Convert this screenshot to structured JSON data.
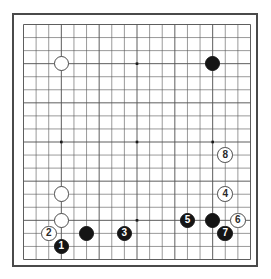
{
  "board": {
    "title": "Go board diagram",
    "size": 19,
    "line_color": "#555555",
    "border_color": "#4a4a4a",
    "background_color": "#ffffff",
    "black_color": "#151515",
    "white_color": "#ffffff",
    "star_points": [
      {
        "col": 3,
        "row": 3
      },
      {
        "col": 9,
        "row": 3
      },
      {
        "col": 15,
        "row": 3
      },
      {
        "col": 3,
        "row": 9
      },
      {
        "col": 9,
        "row": 9
      },
      {
        "col": 15,
        "row": 9
      },
      {
        "col": 3,
        "row": 15
      },
      {
        "col": 9,
        "row": 15
      },
      {
        "col": 15,
        "row": 15
      }
    ],
    "stones": [
      {
        "name": "white-stone-upper-left",
        "color": "white",
        "col": 3,
        "row": 3,
        "label": ""
      },
      {
        "name": "black-stone-upper-right",
        "color": "black",
        "col": 15,
        "row": 3,
        "label": ""
      },
      {
        "name": "white-stone-left-side",
        "color": "white",
        "col": 3,
        "row": 13,
        "label": ""
      },
      {
        "name": "white-stone-lower-left",
        "color": "white",
        "col": 3,
        "row": 15,
        "label": ""
      },
      {
        "name": "black-stone-lower-left",
        "color": "black",
        "col": 5,
        "row": 16,
        "label": ""
      },
      {
        "name": "black-stone-bottom-right",
        "color": "black",
        "col": 15,
        "row": 15,
        "label": ""
      },
      {
        "name": "move-stone-1",
        "color": "black",
        "col": 3,
        "row": 17,
        "label": "1"
      },
      {
        "name": "move-stone-2",
        "color": "white",
        "col": 2,
        "row": 16,
        "label": "2"
      },
      {
        "name": "move-stone-3",
        "color": "black",
        "col": 8,
        "row": 16,
        "label": "3"
      },
      {
        "name": "move-stone-4",
        "color": "white",
        "col": 16,
        "row": 13,
        "label": "4"
      },
      {
        "name": "move-stone-5",
        "color": "black",
        "col": 13,
        "row": 15,
        "label": "5"
      },
      {
        "name": "move-stone-6",
        "color": "white",
        "col": 17,
        "row": 15,
        "label": "6"
      },
      {
        "name": "move-stone-7",
        "color": "black",
        "col": 16,
        "row": 16,
        "label": "7"
      },
      {
        "name": "move-stone-8",
        "color": "white",
        "col": 16,
        "row": 10,
        "label": "8"
      }
    ]
  }
}
